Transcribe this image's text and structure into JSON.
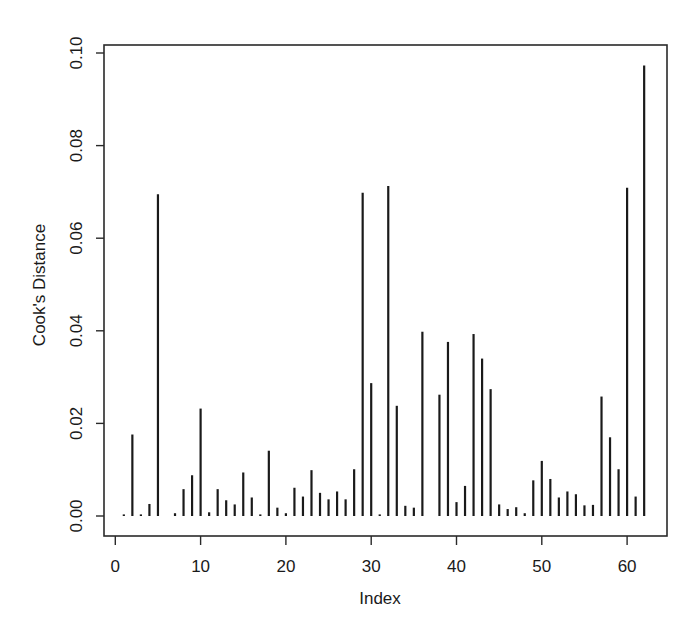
{
  "chart_data": {
    "type": "bar",
    "style": "vertical-lines (R type='h')",
    "title": "",
    "xlabel": "Index",
    "ylabel": "Cook's Distance",
    "xlim": [
      0,
      64
    ],
    "ylim": [
      0,
      0.1
    ],
    "x_ticks": [
      0,
      10,
      20,
      30,
      40,
      50,
      60
    ],
    "x_tick_labels": [
      "0",
      "10",
      "20",
      "30",
      "40",
      "50",
      "60"
    ],
    "y_ticks": [
      0.0,
      0.02,
      0.04,
      0.06,
      0.08,
      0.1
    ],
    "y_tick_labels": [
      "0.00",
      "0.02",
      "0.04",
      "0.06",
      "0.08",
      "0.10"
    ],
    "grid": false,
    "legend": null,
    "x": [
      1,
      2,
      3,
      4,
      5,
      6,
      7,
      8,
      9,
      10,
      11,
      12,
      13,
      14,
      15,
      16,
      17,
      18,
      19,
      20,
      21,
      22,
      23,
      24,
      25,
      26,
      27,
      28,
      29,
      30,
      31,
      32,
      33,
      34,
      35,
      36,
      37,
      38,
      39,
      40,
      41,
      42,
      43,
      44,
      45,
      46,
      47,
      48,
      49,
      50,
      51,
      52,
      53,
      54,
      55,
      56,
      57,
      58,
      59,
      60,
      61,
      62
    ],
    "values": [
      0.0003,
      0.0176,
      0.0003,
      0.0026,
      0.0695,
      0.0,
      0.0006,
      0.0058,
      0.0088,
      0.0232,
      0.0008,
      0.0058,
      0.0034,
      0.0025,
      0.0094,
      0.004,
      0.0003,
      0.0141,
      0.0018,
      0.0006,
      0.0061,
      0.0042,
      0.0099,
      0.005,
      0.0036,
      0.0053,
      0.0036,
      0.0101,
      0.0698,
      0.0287,
      0.0003,
      0.0713,
      0.0238,
      0.0022,
      0.0018,
      0.0398,
      0.0,
      0.0262,
      0.0376,
      0.003,
      0.0065,
      0.0393,
      0.034,
      0.0274,
      0.0025,
      0.0015,
      0.0019,
      0.0006,
      0.0077,
      0.0119,
      0.008,
      0.004,
      0.0053,
      0.0047,
      0.0023,
      0.0024,
      0.0258,
      0.017,
      0.0101,
      0.0709,
      0.0042,
      0.0973
    ]
  },
  "colors": {
    "line": "#1a1a1a",
    "frame": "#2a2a2a",
    "background": "#ffffff"
  }
}
